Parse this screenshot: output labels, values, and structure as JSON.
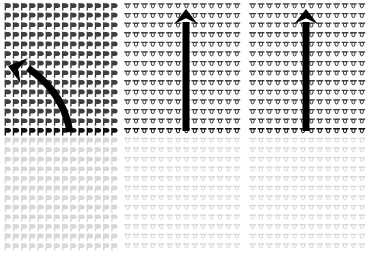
{
  "figure": {
    "title": "Three-panel glyph field diagram with directional arrows",
    "width": 370,
    "height": 257,
    "background_color": "#ffffff"
  },
  "colors": {
    "glyph_dark": "#3f3f3f",
    "glyph_dark_strong": "#222222",
    "glyph_light": "#d8d8d8",
    "glyph_transition": "#111111",
    "arrow": "#000000",
    "background": "#ffffff"
  },
  "panels": [
    {
      "id": "left-panel",
      "name": "left-glyph-field",
      "x": 4,
      "y": 3,
      "width": 114,
      "height": 252,
      "glyph_type": "flag-glyph",
      "columns": 14,
      "rows": 26,
      "cell_width": 8.2,
      "cell_height": 9.6,
      "dark_rows": 13,
      "transition_row_index": 13,
      "arrow": {
        "type": "curved-arrow",
        "name": "curved-left-arrow",
        "direction": "left",
        "tail_x": 70,
        "tail_y": 132,
        "head_x": 8,
        "head_y": 66,
        "stroke_width": 7
      }
    },
    {
      "id": "middle-panel",
      "name": "middle-glyph-field",
      "x": 124,
      "y": 3,
      "width": 117,
      "height": 252,
      "glyph_type": "bowl-glyph",
      "columns": 14,
      "rows": 26,
      "cell_width": 8.4,
      "cell_height": 9.6,
      "dark_rows": 13,
      "transition_row_index": 13,
      "arrow": {
        "type": "straight-arrow",
        "name": "vertical-up-arrow-middle",
        "direction": "up",
        "tail_x": 186,
        "tail_y": 131,
        "head_x": 186,
        "head_y": 9,
        "stroke_width": 7
      }
    },
    {
      "id": "right-panel",
      "name": "right-glyph-field",
      "x": 249,
      "y": 3,
      "width": 117,
      "height": 252,
      "glyph_type": "bowl-glyph",
      "columns": 14,
      "rows": 26,
      "cell_width": 8.4,
      "cell_height": 9.6,
      "dark_rows": 13,
      "transition_row_index": 13,
      "arrow": {
        "type": "straight-arrow",
        "name": "vertical-up-arrow-right",
        "direction": "up",
        "tail_x": 306,
        "tail_y": 131,
        "head_x": 306,
        "head_y": 9,
        "stroke_width": 7
      }
    }
  ],
  "chart_data": {
    "type": "heatmap",
    "title": "Three-panel glyph field diagram with directional arrows",
    "xlabel": "",
    "ylabel": "",
    "legend": [],
    "annotations": [
      {
        "name": "curved-left-arrow",
        "panel": "left-panel",
        "shape": "curved",
        "direction": "left",
        "from": [
          70,
          132
        ],
        "to": [
          8,
          66
        ]
      },
      {
        "name": "vertical-up-arrow-middle",
        "panel": "middle-panel",
        "shape": "straight",
        "direction": "up",
        "from": [
          186,
          131
        ],
        "to": [
          186,
          9
        ]
      },
      {
        "name": "vertical-up-arrow-right",
        "panel": "right-panel",
        "shape": "straight",
        "direction": "up",
        "from": [
          306,
          131
        ],
        "to": [
          306,
          9
        ]
      }
    ],
    "series": [
      {
        "name": "left-panel",
        "glyph": "flag-glyph",
        "columns": 14,
        "rows": 26,
        "dark_rows": 13,
        "light_rows": 13
      },
      {
        "name": "middle-panel",
        "glyph": "bowl-glyph",
        "columns": 14,
        "rows": 26,
        "dark_rows": 13,
        "light_rows": 13
      },
      {
        "name": "right-panel",
        "glyph": "bowl-glyph",
        "columns": 14,
        "rows": 26,
        "dark_rows": 13,
        "light_rows": 13
      }
    ]
  }
}
